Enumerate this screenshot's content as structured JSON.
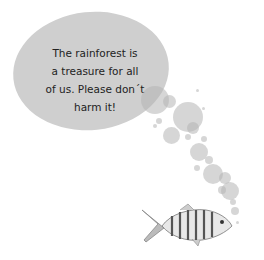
{
  "speech_bubble": {
    "lines": [
      "The rainforest is",
      "a treasure for all",
      "of us. Please don´t",
      "harm it!"
    ]
  },
  "illustration": {
    "subject": "striped fish",
    "bubbles_color": "#c8c8c8",
    "main_bubble_color": "#cfcfcf"
  }
}
